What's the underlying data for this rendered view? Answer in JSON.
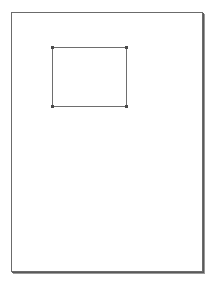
{
  "preview": {
    "kind": "page-layout-preview",
    "page": {
      "x": 11,
      "y": 12,
      "width": 190,
      "height": 258,
      "background": "#ffffff",
      "border_color": "#6b6b6b"
    },
    "selection": {
      "x": 52,
      "y": 47,
      "width": 75,
      "height": 60,
      "border_color": "#6e6e6e",
      "handle_color": "#4a4a4a",
      "handles": [
        "top-left",
        "top-right",
        "bottom-left",
        "bottom-right"
      ]
    }
  }
}
